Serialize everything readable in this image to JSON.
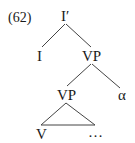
{
  "diagram": {
    "example_number": "(62)",
    "type": "syntax-tree",
    "nodes": {
      "root": "I′",
      "left_child": "I",
      "right_child": "VP",
      "inner_vp": "VP",
      "adjunct": "α",
      "verb": "V",
      "ellipsis": "…"
    },
    "edges": [
      [
        "I′",
        "I"
      ],
      [
        "I′",
        "VP"
      ],
      [
        "VP",
        "VP"
      ],
      [
        "VP",
        "α"
      ],
      [
        "VP",
        "triangle(V … )"
      ]
    ]
  }
}
